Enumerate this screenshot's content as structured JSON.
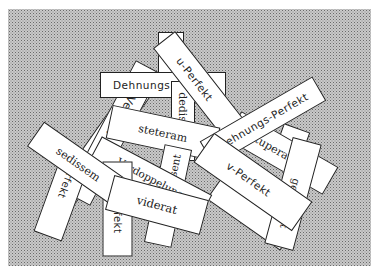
{
  "scene": {
    "description": "Scattered white paper slips with Latin and German grammar terms on a stippled grey background",
    "background_color": "#c9c9c9",
    "card_color": "#ffffff",
    "ink_color": "#222222"
  },
  "cards": [
    {
      "id": "blank-top-right",
      "text": ""
    },
    {
      "id": "blank-long-left",
      "text": ""
    },
    {
      "id": "verdoppelung-vertical",
      "text": "Verdoppelung"
    },
    {
      "id": "dehnungs",
      "text": "Dehnungs"
    },
    {
      "id": "u-perfekt",
      "text": "u-Perfekt"
    },
    {
      "id": "dedisti",
      "text": "dedisti"
    },
    {
      "id": "blank-right-small",
      "text": ""
    },
    {
      "id": "tutuperavi",
      "text": "tutuperavi"
    },
    {
      "id": "dehnungs-perfekt",
      "text": "Dehnungs-Perfekt"
    },
    {
      "id": "steteram",
      "text": "steteram"
    },
    {
      "id": "verdoppelung",
      "text": "Verdoppelung"
    },
    {
      "id": "s-perfekt",
      "text": "s-Perfekt"
    },
    {
      "id": "k-perfekt",
      "text": "k-Perfekt"
    },
    {
      "id": "sedissem",
      "text": "sedissem"
    },
    {
      "id": "suasissent",
      "text": "suasissent"
    },
    {
      "id": "v-perfekt",
      "text": "v-Perfekt"
    },
    {
      "id": "genuisset",
      "text": "genuisset"
    },
    {
      "id": "viderat",
      "text": "viderat"
    }
  ]
}
